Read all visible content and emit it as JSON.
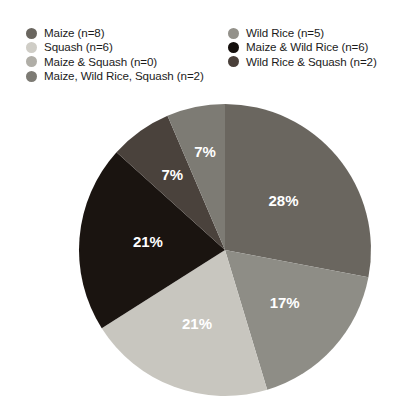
{
  "legend": {
    "left_column": [
      {
        "label": "Maize (n=8)",
        "color": "#6a665f",
        "name": "maize"
      },
      {
        "label": "Squash (n=6)",
        "color": "#cfcdc6",
        "name": "squash"
      },
      {
        "label": "Maize & Squash (n=0)",
        "color": "#b0aea7",
        "name": "maize-squash"
      },
      {
        "label": "Maize, Wild Rice, Squash (n=2)",
        "color": "#7d7b74",
        "name": "maize-wild-rice-squash"
      }
    ],
    "right_column": [
      {
        "label": "Wild Rice (n=5)",
        "color": "#93918a",
        "name": "wild-rice"
      },
      {
        "label": "Maize & Wild Rice (n=6)",
        "color": "#140f0c",
        "name": "maize-wild-rice"
      },
      {
        "label": "Wild Rice & Squash (n=2)",
        "color": "#4a403a",
        "name": "wild-rice-squash"
      }
    ]
  },
  "chart_data": {
    "type": "pie",
    "title": "",
    "xlabel": "",
    "ylabel": "",
    "legend_position": "top",
    "total_n": 29,
    "categories": [
      "Maize (n=8)",
      "Wild Rice (n=5)",
      "Squash (n=6)",
      "Maize & Wild Rice (n=6)",
      "Wild Rice & Squash (n=2)",
      "Maize, Wild Rice, Squash (n=2)",
      "Maize & Squash (n=0)"
    ],
    "values": [
      28,
      17,
      21,
      21,
      7,
      7,
      0
    ],
    "counts": [
      8,
      5,
      6,
      6,
      2,
      2,
      0
    ],
    "colors": [
      "#6a665f",
      "#8e8d86",
      "#c8c6bf",
      "#1a1410",
      "#4a423c",
      "#7d7b74",
      "#b0aea7"
    ],
    "slices": [
      {
        "name": "maize",
        "label": "Maize (n=8)",
        "value": 28,
        "count": 8,
        "display": "28%",
        "color": "#6a665f",
        "start_angle": 0,
        "end_angle": 100.8,
        "label_angle": 50.4,
        "label_radius": 0.52,
        "show_label": true
      },
      {
        "name": "wild-rice",
        "label": "Wild Rice (n=5)",
        "value": 17,
        "count": 5,
        "display": "17%",
        "color": "#8e8d86",
        "start_angle": 100.8,
        "end_angle": 163.2,
        "label_angle": 132.0,
        "label_radius": 0.55,
        "show_label": true
      },
      {
        "name": "squash",
        "label": "Squash (n=6)",
        "value": 21,
        "count": 6,
        "display": "21%",
        "color": "#c8c6bf",
        "start_angle": 163.2,
        "end_angle": 237.6,
        "label_angle": 200.4,
        "label_radius": 0.55,
        "show_label": true
      },
      {
        "name": "maize-wild-rice",
        "label": "Maize & Wild Rice (n=6)",
        "value": 21,
        "count": 6,
        "display": "21%",
        "color": "#1a1410",
        "start_angle": 237.6,
        "end_angle": 312.0,
        "label_angle": 274.8,
        "label_radius": 0.53,
        "show_label": true
      },
      {
        "name": "wild-rice-squash",
        "label": "Wild Rice & Squash (n=2)",
        "value": 7,
        "count": 2,
        "display": "7%",
        "color": "#4a423c",
        "start_angle": 312.0,
        "end_angle": 336.8,
        "label_angle": 324.4,
        "label_radius": 0.62,
        "show_label": true
      },
      {
        "name": "maize-wild-rice-squash",
        "label": "Maize, Wild Rice, Squash (n=2)",
        "value": 7,
        "count": 2,
        "display": "7%",
        "color": "#7d7b74",
        "start_angle": 336.8,
        "end_angle": 360.0,
        "label_angle": 348.4,
        "label_radius": 0.68,
        "show_label": true
      }
    ],
    "geometry": {
      "cx": 225,
      "cy": 150,
      "r": 146
    }
  }
}
